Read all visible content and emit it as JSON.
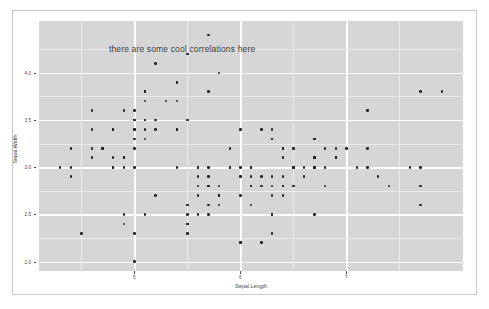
{
  "chart_data": {
    "type": "scatter",
    "title": "",
    "annotation": "there are some cool correlations here",
    "annotation_x": 5.45,
    "annotation_y": 4.25,
    "xlabel": "Sepal.Length",
    "ylabel": "Sepal.Width",
    "xlim": [
      4.1,
      8.1
    ],
    "ylim": [
      1.9,
      4.55
    ],
    "xticks": [
      5,
      6,
      7
    ],
    "xtick_labels": [
      "5",
      "6",
      "7"
    ],
    "yticks": [
      2.0,
      2.5,
      3.0,
      3.5,
      4.0
    ],
    "ytick_labels": [
      "2.0",
      "2.5",
      "3.0",
      "3.5",
      "4.0"
    ],
    "x_minor_ticks": [
      4.5,
      5.5,
      6.5,
      7.5
    ],
    "y_minor_ticks": [
      2.25,
      2.75,
      3.25,
      3.75,
      4.25
    ],
    "grid": true,
    "legend": "none",
    "panel_background": "#d6d6d6",
    "grid_color": "#ffffff",
    "point_color": "#232323",
    "point_size": 2.6,
    "x": [
      5.1,
      4.9,
      4.7,
      4.6,
      5.0,
      5.4,
      4.6,
      5.0,
      4.4,
      4.9,
      5.4,
      4.8,
      4.8,
      4.3,
      5.8,
      5.7,
      5.4,
      5.1,
      5.7,
      5.1,
      5.4,
      5.1,
      4.6,
      5.1,
      4.8,
      5.0,
      5.0,
      5.2,
      5.2,
      4.7,
      4.8,
      5.4,
      5.2,
      5.5,
      4.9,
      5.0,
      5.5,
      4.9,
      4.4,
      5.1,
      5.0,
      4.5,
      4.4,
      5.0,
      5.1,
      4.8,
      5.1,
      4.6,
      5.3,
      5.0,
      7.0,
      6.4,
      6.9,
      5.5,
      6.5,
      5.7,
      6.3,
      4.9,
      6.6,
      5.2,
      5.0,
      5.9,
      6.0,
      6.1,
      5.6,
      6.7,
      5.6,
      5.8,
      6.2,
      5.6,
      5.9,
      6.1,
      6.3,
      6.1,
      6.4,
      6.6,
      6.8,
      6.7,
      6.0,
      5.7,
      5.5,
      5.5,
      5.8,
      6.0,
      5.4,
      6.0,
      6.7,
      6.3,
      5.6,
      5.5,
      5.5,
      6.1,
      5.8,
      5.0,
      5.6,
      5.7,
      5.7,
      6.2,
      5.1,
      5.7,
      6.3,
      5.8,
      7.1,
      6.3,
      6.5,
      7.6,
      4.9,
      7.3,
      6.7,
      7.2,
      6.5,
      6.4,
      6.8,
      5.7,
      5.8,
      6.4,
      6.5,
      7.7,
      7.7,
      6.0,
      6.9,
      5.6,
      7.7,
      6.3,
      6.7,
      7.2,
      6.2,
      6.1,
      6.4,
      7.2,
      7.4,
      7.9,
      6.4,
      6.3,
      6.1,
      7.7,
      6.3,
      6.4,
      6.0,
      6.9,
      6.7,
      6.9,
      5.8,
      6.8,
      6.7,
      6.7,
      6.3,
      6.5,
      6.2,
      5.9
    ],
    "y": [
      3.5,
      3.0,
      3.2,
      3.1,
      3.6,
      3.9,
      3.4,
      3.4,
      2.9,
      3.1,
      3.7,
      3.4,
      3.0,
      3.0,
      4.0,
      4.4,
      3.9,
      3.5,
      3.8,
      3.8,
      3.4,
      3.7,
      3.6,
      3.3,
      3.4,
      3.0,
      3.4,
      3.5,
      3.4,
      3.2,
      3.1,
      3.4,
      4.1,
      4.2,
      3.1,
      3.2,
      3.5,
      3.6,
      3.0,
      3.4,
      3.5,
      2.3,
      3.2,
      3.5,
      3.8,
      3.0,
      3.8,
      3.2,
      3.7,
      3.3,
      3.2,
      3.2,
      3.1,
      2.3,
      2.8,
      2.8,
      3.3,
      2.4,
      2.9,
      2.7,
      2.0,
      3.0,
      2.2,
      2.9,
      2.9,
      3.1,
      3.0,
      2.7,
      2.2,
      2.5,
      3.2,
      2.8,
      2.5,
      2.8,
      2.9,
      3.0,
      2.8,
      3.0,
      2.9,
      2.6,
      2.4,
      2.4,
      2.7,
      2.7,
      3.0,
      3.4,
      3.1,
      2.3,
      3.0,
      2.5,
      2.6,
      3.0,
      2.6,
      2.3,
      2.7,
      3.0,
      2.9,
      2.9,
      2.5,
      2.8,
      3.3,
      2.7,
      3.0,
      2.9,
      3.0,
      3.0,
      2.5,
      2.9,
      2.5,
      3.6,
      3.2,
      2.7,
      3.0,
      2.5,
      2.8,
      3.2,
      3.0,
      3.8,
      2.6,
      2.2,
      3.2,
      2.8,
      2.8,
      2.7,
      3.3,
      3.2,
      2.8,
      3.0,
      2.8,
      3.0,
      2.8,
      3.8,
      2.8,
      2.8,
      2.6,
      3.0,
      3.4,
      3.1,
      3.0,
      3.1,
      3.1,
      3.1,
      2.7,
      3.2,
      3.3,
      3.0,
      2.5,
      3.0,
      3.4,
      3.0
    ]
  }
}
